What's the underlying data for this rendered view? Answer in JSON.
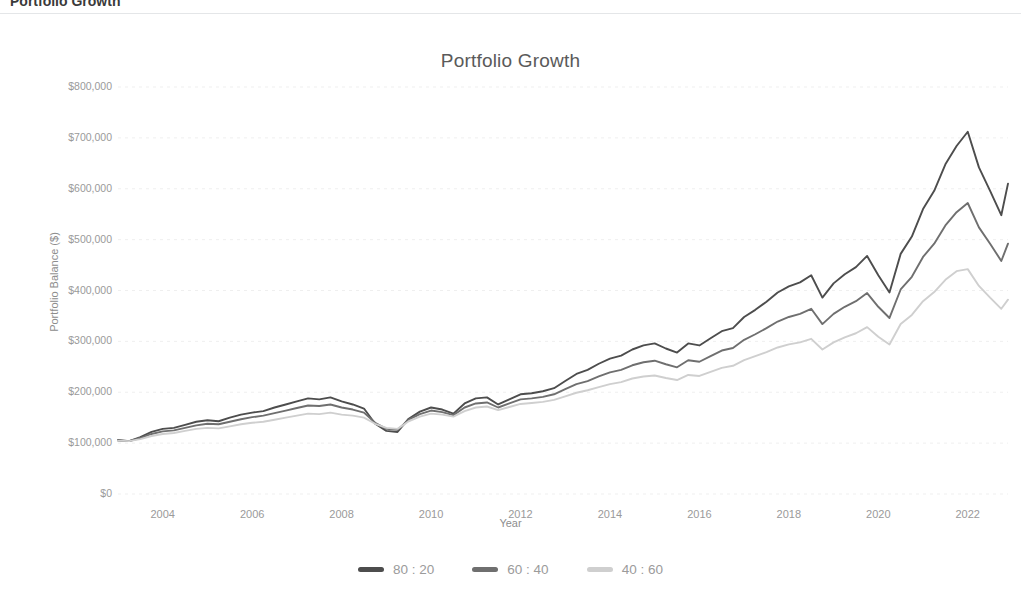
{
  "page_header": {
    "title": "Portfolio Growth"
  },
  "chart_data": {
    "type": "line",
    "title": "Portfolio Growth",
    "xlabel": "Year",
    "ylabel": "Portfolio Balance ($)",
    "xlim": [
      2003,
      2022.9
    ],
    "ylim": [
      0,
      800000
    ],
    "grid": true,
    "legend_position": "bottom",
    "ytick_labels": [
      "$800,000",
      "$700,000",
      "$600,000",
      "$500,000",
      "$400,000",
      "$300,000",
      "$200,000",
      "$100,000",
      "$0"
    ],
    "ytick_values": [
      800000,
      700000,
      600000,
      500000,
      400000,
      300000,
      200000,
      100000,
      0
    ],
    "xtick_labels": [
      "2004",
      "2006",
      "2008",
      "2010",
      "2012",
      "2014",
      "2016",
      "2018",
      "2020",
      "2022"
    ],
    "xtick_values": [
      2004,
      2006,
      2008,
      2010,
      2012,
      2014,
      2016,
      2018,
      2020,
      2022
    ],
    "colors": {
      "series_80_20": "#4d4d4d",
      "series_60_40": "#6f6f6f",
      "series_40_60": "#cfcfcf",
      "grid": "#efefef",
      "text": "#9a9a9a"
    },
    "x": [
      2003.0,
      2003.25,
      2003.5,
      2003.75,
      2004.0,
      2004.25,
      2004.5,
      2004.75,
      2005.0,
      2005.25,
      2005.5,
      2005.75,
      2006.0,
      2006.25,
      2006.5,
      2006.75,
      2007.0,
      2007.25,
      2007.5,
      2007.75,
      2008.0,
      2008.25,
      2008.5,
      2008.75,
      2009.0,
      2009.25,
      2009.5,
      2009.75,
      2010.0,
      2010.25,
      2010.5,
      2010.75,
      2011.0,
      2011.25,
      2011.5,
      2011.75,
      2012.0,
      2012.25,
      2012.5,
      2012.75,
      2013.0,
      2013.25,
      2013.5,
      2013.75,
      2014.0,
      2014.25,
      2014.5,
      2014.75,
      2015.0,
      2015.25,
      2015.5,
      2015.75,
      2016.0,
      2016.25,
      2016.5,
      2016.75,
      2017.0,
      2017.25,
      2017.5,
      2017.75,
      2018.0,
      2018.25,
      2018.5,
      2018.75,
      2019.0,
      2019.25,
      2019.5,
      2019.75,
      2020.0,
      2020.25,
      2020.5,
      2020.75,
      2021.0,
      2021.25,
      2021.5,
      2021.75,
      2022.0,
      2022.25,
      2022.5,
      2022.75,
      2022.9
    ],
    "series": [
      {
        "name": "80 : 20",
        "color": "#4d4d4d",
        "values": [
          106000,
          104000,
          112000,
          122000,
          128000,
          130000,
          136000,
          142000,
          145000,
          143000,
          150000,
          156000,
          160000,
          163000,
          170000,
          176000,
          182000,
          188000,
          186000,
          190000,
          182000,
          176000,
          168000,
          138000,
          124000,
          122000,
          148000,
          162000,
          170000,
          166000,
          158000,
          178000,
          188000,
          190000,
          176000,
          186000,
          196000,
          198000,
          202000,
          208000,
          222000,
          236000,
          244000,
          256000,
          266000,
          272000,
          284000,
          292000,
          296000,
          286000,
          278000,
          296000,
          292000,
          306000,
          320000,
          326000,
          348000,
          362000,
          378000,
          396000,
          408000,
          416000,
          430000,
          386000,
          414000,
          432000,
          446000,
          468000,
          430000,
          396000,
          472000,
          506000,
          560000,
          596000,
          648000,
          684000,
          712000,
          642000,
          596000,
          548000,
          610000
        ]
      },
      {
        "name": "60 : 40",
        "color": "#6f6f6f",
        "values": [
          105000,
          104000,
          110000,
          118000,
          123000,
          125000,
          130000,
          135000,
          138000,
          137000,
          142000,
          147000,
          151000,
          154000,
          159000,
          164000,
          169000,
          174000,
          173000,
          176000,
          170000,
          166000,
          160000,
          140000,
          128000,
          126000,
          146000,
          157000,
          164000,
          161000,
          155000,
          170000,
          178000,
          180000,
          170000,
          178000,
          186000,
          188000,
          191000,
          196000,
          206000,
          216000,
          222000,
          231000,
          239000,
          244000,
          253000,
          259000,
          262000,
          255000,
          249000,
          263000,
          260000,
          271000,
          282000,
          287000,
          303000,
          314000,
          326000,
          339000,
          348000,
          354000,
          364000,
          334000,
          354000,
          368000,
          379000,
          395000,
          368000,
          346000,
          402000,
          427000,
          466000,
          492000,
          528000,
          554000,
          572000,
          524000,
          492000,
          458000,
          492000
        ]
      },
      {
        "name": "40 : 60",
        "color": "#cfcfcf",
        "values": [
          105000,
          104000,
          108000,
          114000,
          118000,
          120000,
          124000,
          128000,
          130000,
          129000,
          133000,
          137000,
          140000,
          142000,
          146000,
          150000,
          154000,
          158000,
          157000,
          160000,
          156000,
          154000,
          150000,
          138000,
          130000,
          128000,
          143000,
          152000,
          158000,
          156000,
          152000,
          163000,
          170000,
          172000,
          165000,
          171000,
          177000,
          179000,
          181000,
          185000,
          192000,
          199000,
          204000,
          210000,
          216000,
          220000,
          227000,
          231000,
          233000,
          228000,
          224000,
          234000,
          232000,
          240000,
          248000,
          252000,
          263000,
          271000,
          279000,
          288000,
          294000,
          298000,
          305000,
          284000,
          298000,
          308000,
          316000,
          328000,
          309000,
          294000,
          334000,
          352000,
          379000,
          397000,
          421000,
          438000,
          442000,
          409000,
          386000,
          364000,
          382000
        ]
      }
    ]
  }
}
